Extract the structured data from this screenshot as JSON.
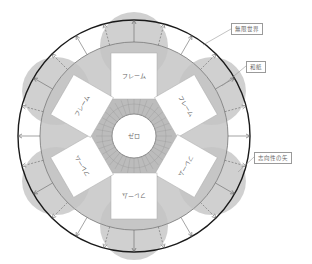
{
  "diagram": {
    "center_label": "ゼロ",
    "frames": [
      {
        "label": "フレーム",
        "angle_deg": -90
      },
      {
        "label": "フレーム",
        "angle_deg": -30
      },
      {
        "label": "フレーム",
        "angle_deg": 30
      },
      {
        "label": "フレーム",
        "angle_deg": 90
      },
      {
        "label": "フレーム",
        "angle_deg": 150
      },
      {
        "label": "フレーム",
        "angle_deg": 210
      }
    ],
    "callouts": [
      {
        "id": "infinite-world",
        "label": "無限世界"
      },
      {
        "id": "washi",
        "label": "和紙"
      },
      {
        "id": "arrow-of-intentionality",
        "label": "志向性の矢"
      }
    ],
    "colors": {
      "outer_ring": "#1a1a1a",
      "lobe_fill": "#c4c4c4",
      "ring_fill": "#bdbdbd",
      "hex_fill": "#b8b8b8",
      "frame_fill": "#ffffff",
      "line": "#7a7a7a"
    }
  }
}
